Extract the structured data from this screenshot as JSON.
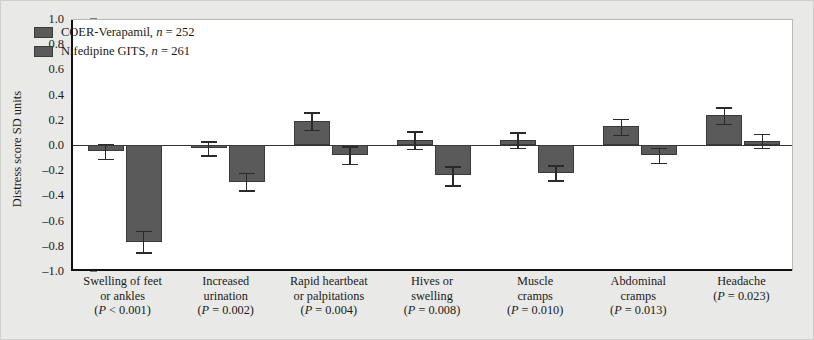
{
  "figure": {
    "background_color": "#e9e9e7",
    "plot_background_color": "#ffffff",
    "axis_color": "#111111"
  },
  "legend": {
    "position": "top-left-inside",
    "entries": [
      {
        "label": "COER-Verapamil, ",
        "n_text": "n",
        "n_value": " = 252",
        "color": "#5a5a5a"
      },
      {
        "label": "Nifedipine GITS, ",
        "n_text": "n",
        "n_value": " = 261",
        "color": "#5a5a5a"
      }
    ]
  },
  "chart_data": {
    "type": "bar",
    "title": "",
    "subtitle": "",
    "xlabel": "",
    "ylabel": "Distress score SD units",
    "ylim": [
      -1.0,
      1.0
    ],
    "ytick_step": 0.2,
    "yticks": [
      "1.0",
      "0.8",
      "0.6",
      "0.4",
      "0.2",
      "0.0",
      "-0.2",
      "-0.4",
      "-0.6",
      "-0.8",
      "-1.0"
    ],
    "ytick_values": [
      1.0,
      0.8,
      0.6,
      0.4,
      0.2,
      0.0,
      -0.2,
      -0.4,
      -0.6,
      -0.8,
      -1.0
    ],
    "grid": false,
    "zero_line": true,
    "legend_position": "upper left",
    "categories": [
      "Swelling of feet or ankles",
      "Increased urination",
      "Rapid heartbeat or palpitations",
      "Hives or swelling",
      "Muscle cramps",
      "Abdominal cramps",
      "Headache"
    ],
    "category_lines": [
      [
        "Swelling of feet",
        "or ankles"
      ],
      [
        "Increased",
        "urination"
      ],
      [
        "Rapid heartbeat",
        "or palpitations"
      ],
      [
        "Hives or",
        "swelling"
      ],
      [
        "Muscle",
        "cramps"
      ],
      [
        "Abdominal",
        "cramps"
      ],
      [
        "Headache"
      ]
    ],
    "category_pvalues": [
      "P < 0.001",
      "P = 0.002",
      "P = 0.004",
      "P = 0.008",
      "P = 0.010",
      "P = 0.013",
      "P = 0.023"
    ],
    "series": [
      {
        "name": "COER-Verapamil, n = 252",
        "color": "#5a5a5a",
        "values": [
          -0.05,
          -0.02,
          0.19,
          0.04,
          0.04,
          0.15,
          0.24
        ],
        "error_upper": [
          0.01,
          0.03,
          0.26,
          0.11,
          0.1,
          0.21,
          0.3
        ],
        "error_lower": [
          -0.11,
          -0.08,
          0.12,
          -0.03,
          -0.02,
          0.08,
          0.17
        ]
      },
      {
        "name": "Nifedipine GITS, n = 261",
        "color": "#5a5a5a",
        "values": [
          -0.77,
          -0.29,
          -0.08,
          -0.24,
          -0.22,
          -0.08,
          0.03
        ],
        "error_upper": [
          -0.68,
          -0.22,
          -0.01,
          -0.17,
          -0.16,
          -0.02,
          0.09
        ],
        "error_lower": [
          -0.85,
          -0.36,
          -0.15,
          -0.32,
          -0.28,
          -0.14,
          -0.02
        ]
      }
    ]
  }
}
